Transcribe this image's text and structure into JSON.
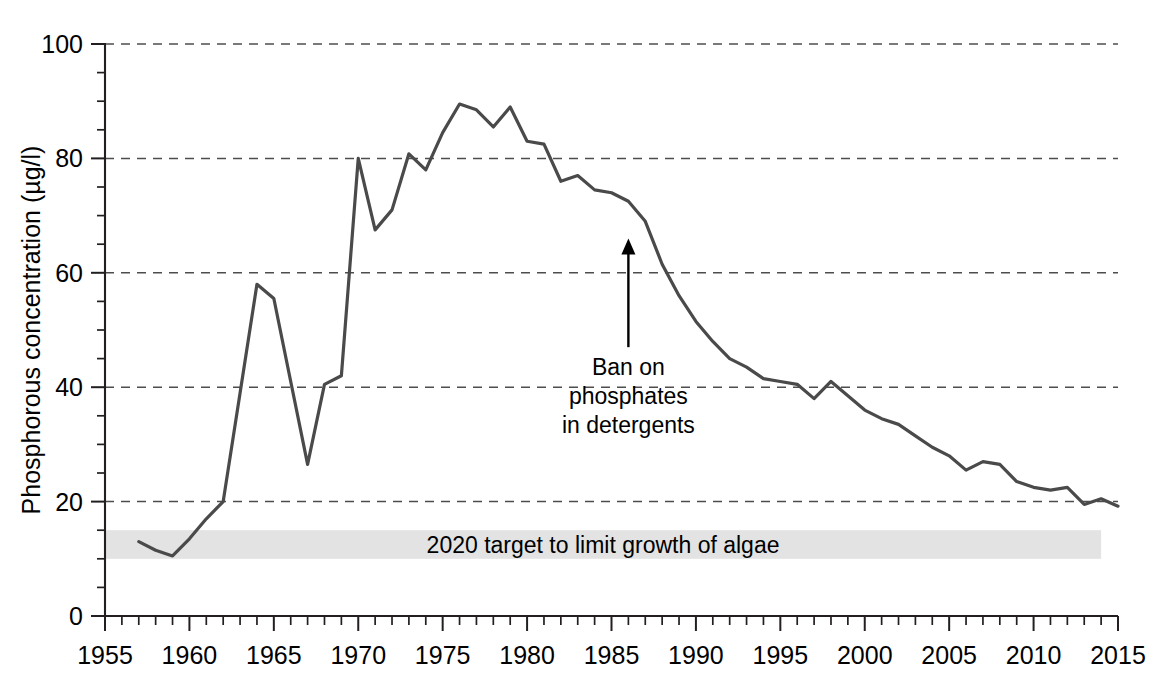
{
  "chart_data": {
    "type": "line",
    "title": "",
    "xlabel": "",
    "ylabel": "Phosphorous concentration (µg/l)",
    "xlim": [
      1955,
      2015
    ],
    "ylim": [
      0,
      100
    ],
    "grid": true,
    "legend": "none",
    "x_tick_labels": [
      "1955",
      "1960",
      "1965",
      "1970",
      "1975",
      "1980",
      "1985",
      "1990",
      "1995",
      "2000",
      "2005",
      "2010",
      "2015"
    ],
    "x_tick_values": [
      1955,
      1960,
      1965,
      1970,
      1975,
      1980,
      1985,
      1990,
      1995,
      2000,
      2005,
      2010,
      2015
    ],
    "x_minor_step": 1,
    "y_tick_labels": [
      "0",
      "20",
      "40",
      "60",
      "80",
      "100"
    ],
    "y_tick_values": [
      0,
      20,
      40,
      60,
      80,
      100
    ],
    "y_minor_step": 5,
    "gridline_values": [
      20,
      40,
      60,
      80,
      100
    ],
    "series": [
      {
        "name": "Phosphorous concentration",
        "color": "#4a4a4a",
        "x": [
          1957,
          1958,
          1959,
          1960,
          1961,
          1962,
          1963,
          1964,
          1965,
          1966,
          1967,
          1968,
          1969,
          1970,
          1971,
          1972,
          1973,
          1974,
          1975,
          1976,
          1977,
          1978,
          1979,
          1980,
          1981,
          1982,
          1983,
          1984,
          1985,
          1986,
          1987,
          1988,
          1989,
          1990,
          1991,
          1992,
          1993,
          1994,
          1995,
          1996,
          1997,
          1998,
          1999,
          2000,
          2001,
          2002,
          2003,
          2004,
          2005,
          2006,
          2007,
          2008,
          2009,
          2010,
          2011,
          2012,
          2013,
          2014,
          2015
        ],
        "y": [
          13.0,
          11.5,
          10.5,
          13.5,
          17.0,
          20.0,
          39.0,
          58.0,
          55.5,
          41.0,
          26.5,
          40.5,
          42.0,
          80.0,
          67.5,
          71.0,
          80.8,
          78.0,
          84.5,
          89.5,
          88.5,
          85.5,
          89.0,
          83.0,
          82.5,
          76.0,
          77.0,
          74.5,
          74.0,
          72.5,
          69.0,
          61.5,
          56.0,
          51.5,
          48.0,
          45.0,
          43.5,
          41.5,
          41.0,
          40.5,
          38.0,
          41.0,
          38.5,
          36.0,
          34.5,
          33.5,
          31.5,
          29.5,
          28.0,
          25.5,
          27.0,
          26.5,
          23.5,
          22.5,
          22.0,
          22.5,
          19.5,
          20.5,
          19.2
        ]
      }
    ],
    "bands": [
      {
        "name": "target-band",
        "label": "2020 target to limit growth of algae",
        "y_min": 10,
        "y_max": 15,
        "x_min": 1955,
        "x_max": 2014,
        "color": "#e3e3e3"
      }
    ],
    "annotations": [
      {
        "name": "phosphate-ban-annotation",
        "lines": [
          "Ban on",
          "phosphates",
          "in detergents"
        ],
        "arrow_x": 1986,
        "arrow_y_tip": 66,
        "arrow_y_base": 47
      }
    ]
  }
}
